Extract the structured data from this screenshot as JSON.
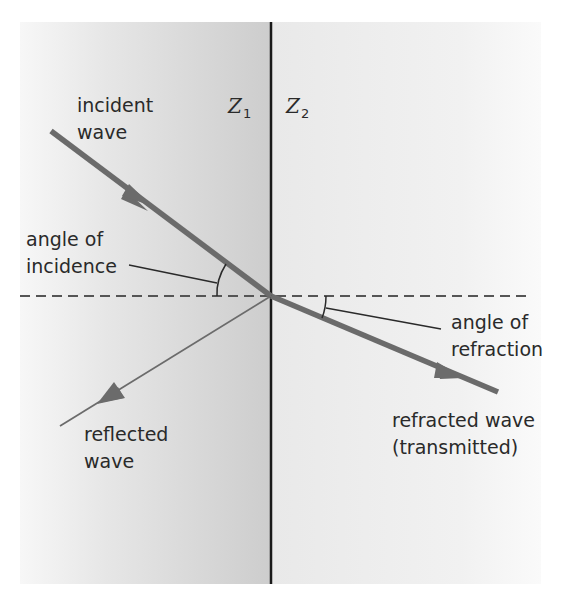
{
  "diagram": {
    "media": {
      "left": {
        "symbol": "Z",
        "subscript": "1"
      },
      "right": {
        "symbol": "Z",
        "subscript": "2"
      }
    },
    "labels": {
      "incident_line1": "incident",
      "incident_line2": "wave",
      "incidence_angle_line1": "angle of",
      "incidence_angle_line2": "incidence",
      "refraction_angle_line1": "angle of",
      "refraction_angle_line2": "refraction",
      "reflected_line1": "reflected",
      "reflected_line2": "wave",
      "refracted_line1": "refracted wave",
      "refracted_line2": "(transmitted)"
    },
    "colors": {
      "wave": "#6b6b6b",
      "boundary": "#1a1a1a",
      "dashed_normal": "#555555",
      "text": "#2a2a2a",
      "medium_left_dark": "#cfcfcf",
      "medium_right": "#ececec"
    }
  }
}
